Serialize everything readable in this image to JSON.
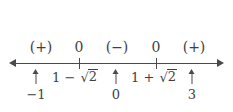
{
  "diagram": {
    "type": "sign-chart-number-line",
    "line": {
      "has_left_arrow": true,
      "has_right_arrow": true,
      "color": "#4a4a4a"
    },
    "sign_row": [
      {
        "id": "interval-left",
        "label": "(+)"
      },
      {
        "id": "root-left-zero",
        "label": "0"
      },
      {
        "id": "interval-middle",
        "label": "(−)"
      },
      {
        "id": "root-right-zero",
        "label": "0"
      },
      {
        "id": "interval-right",
        "label": "(+)"
      }
    ],
    "roots": [
      {
        "id": "root-left",
        "whole": "1 − √2",
        "lead": "1 − ",
        "radical_symbol": "√",
        "radicand": "2"
      },
      {
        "id": "root-right",
        "whole": "1 + √2",
        "lead": "1 + ",
        "radical_symbol": "√",
        "radicand": "2"
      }
    ],
    "test_points": [
      {
        "id": "test-point-left",
        "value": "−1",
        "arrow": "↑"
      },
      {
        "id": "test-point-middle",
        "value": "0",
        "arrow": "↑"
      },
      {
        "id": "test-point-right",
        "value": "3",
        "arrow": "↑"
      }
    ],
    "colors": {
      "background": "#ffffff",
      "ink": "#3f3f3f",
      "line": "#4a4a4a"
    }
  }
}
